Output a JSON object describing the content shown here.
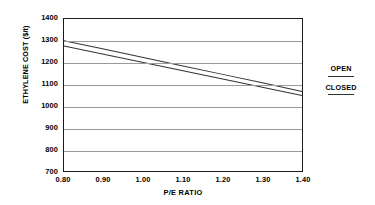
{
  "chart_data": {
    "type": "line",
    "title": "",
    "xlabel": "P/E RATIO",
    "ylabel": "ETHYLENE COST ($/t)",
    "x": [
      0.8,
      0.9,
      1.0,
      1.1,
      1.2,
      1.3,
      1.4
    ],
    "xlim": [
      0.8,
      1.4
    ],
    "ylim": [
      700,
      1400
    ],
    "xticks": [
      "0.80",
      "0.90",
      "1.00",
      "1.10",
      "1.20",
      "1.30",
      "1.40"
    ],
    "yticks": [
      "1400",
      "1300",
      "1200",
      "1100",
      "1000",
      "900",
      "800",
      "700"
    ],
    "ytick_values": [
      1400,
      1300,
      1200,
      1100,
      1000,
      900,
      800,
      700
    ],
    "grid": "horizontal",
    "legend_position": "right",
    "series": [
      {
        "name": "OPEN",
        "color": "#333333",
        "values": [
          1300,
          1262,
          1223,
          1184,
          1145,
          1106,
          1066
        ]
      },
      {
        "name": "CLOSED",
        "color": "#333333",
        "values": [
          1276,
          1238,
          1200,
          1162,
          1124,
          1086,
          1048
        ]
      }
    ]
  },
  "legend": {
    "entries": [
      {
        "label": "OPEN"
      },
      {
        "label": "CLOSED"
      }
    ]
  },
  "colors": {
    "axis": "#1a1a1a",
    "grid": "#9a9a9a",
    "series": "#333333",
    "background": "#ffffff"
  }
}
